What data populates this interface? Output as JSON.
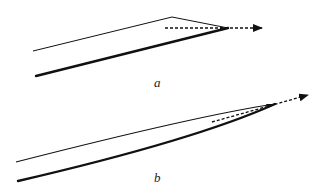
{
  "panels": [
    {
      "id": "a",
      "label": "a",
      "description": "Straight-edged wedge with a dashed arrow extending from the apex",
      "thin_edge": {
        "points": [
          [
            33,
            51
          ],
          [
            172,
            17
          ],
          [
            228,
            28
          ]
        ]
      },
      "thick_edge": {
        "points": [
          [
            36,
            76
          ],
          [
            228,
            28
          ]
        ]
      },
      "dashed_arrow": {
        "from": [
          165,
          28
        ],
        "to": [
          262,
          28
        ]
      }
    },
    {
      "id": "b",
      "label": "b",
      "description": "Curved wedge converging to an apex with a dashed arrow",
      "thin_edge": {
        "start": [
          16,
          162
        ],
        "control": [
          200,
          115
        ],
        "end": [
          275,
          104
        ]
      },
      "thick_edge": {
        "start": [
          18,
          181
        ],
        "control": [
          195,
          140
        ],
        "end": [
          275,
          104
        ]
      },
      "dashed_arrow": {
        "from": [
          212,
          122
        ],
        "to": [
          308,
          95
        ]
      }
    }
  ],
  "colors": {
    "stroke": "#111111",
    "background": "#ffffff"
  }
}
